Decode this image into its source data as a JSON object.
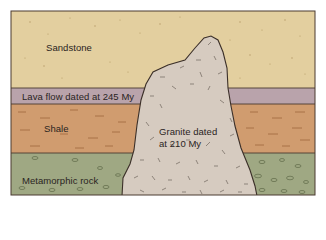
{
  "diagram": {
    "type": "geologic-cross-section",
    "layers": [
      {
        "id": "sandstone",
        "label": "Sandstone",
        "color": "#e3cf9f",
        "top": 11,
        "bottom": 88
      },
      {
        "id": "lava-flow",
        "label": "Lava flow dated at 245 My",
        "color": "#b9a3ab",
        "top": 88,
        "bottom": 104
      },
      {
        "id": "shale",
        "label": "Shale",
        "color": "#d09c6f",
        "top": 104,
        "bottom": 153
      },
      {
        "id": "metamorphic-rock",
        "label": "Metamorphic rock",
        "color": "#9fa883",
        "top": 153,
        "bottom": 195
      }
    ],
    "intrusion": {
      "id": "granite",
      "label_line1": "Granite dated",
      "label_line2": "at 210 My",
      "color": "#d6cbc0"
    },
    "outline_color": "#3b2f28"
  }
}
